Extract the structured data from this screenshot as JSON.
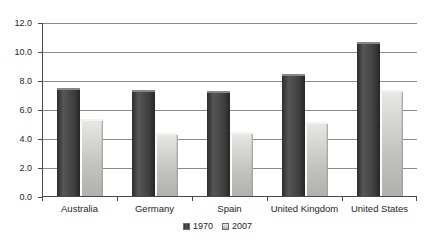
{
  "chart_data": {
    "type": "bar",
    "title": "",
    "xlabel": "",
    "ylabel": "",
    "categories": [
      "Australia",
      "Germany",
      "Spain",
      "United Kingdom",
      "United States"
    ],
    "series": [
      {
        "name": "1970",
        "color": "#474747",
        "values": [
          7.5,
          7.4,
          7.3,
          8.5,
          10.7
        ]
      },
      {
        "name": "2007",
        "color": "#c9c9c5",
        "values": [
          5.4,
          4.4,
          4.5,
          5.2,
          7.4
        ]
      }
    ],
    "ylim": [
      0,
      12
    ],
    "ytick_step": 2,
    "ytick_labels": [
      "0.0",
      "2.0",
      "4.0",
      "6.0",
      "8.0",
      "10.0",
      "12.0"
    ],
    "grid": true,
    "gridline_color": "#8c8c8c",
    "axis_color": "#4a4a4a",
    "legend_position": "bottom"
  }
}
